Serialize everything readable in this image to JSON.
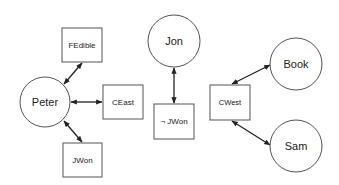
{
  "diagram": {
    "type": "graph",
    "nodes": [
      {
        "id": "peter",
        "label": "Peter",
        "shape": "circle",
        "cx": 45,
        "cy": 102,
        "r": 25
      },
      {
        "id": "fedible",
        "label": "FEdible",
        "shape": "box",
        "x": 62,
        "y": 28,
        "w": 40,
        "h": 34
      },
      {
        "id": "ceast",
        "label": "CEast",
        "shape": "box",
        "x": 103,
        "y": 85,
        "w": 40,
        "h": 34
      },
      {
        "id": "jwon",
        "label": "JWon",
        "shape": "box",
        "x": 63,
        "y": 143,
        "w": 39,
        "h": 34
      },
      {
        "id": "jon",
        "label": "Jon",
        "shape": "circle",
        "cx": 174,
        "cy": 41,
        "r": 26
      },
      {
        "id": "notjwon",
        "label": "¬ JWon",
        "shape": "box",
        "x": 154,
        "y": 104,
        "w": 40,
        "h": 35
      },
      {
        "id": "cwest",
        "label": "CWest",
        "shape": "box",
        "x": 210,
        "y": 85,
        "w": 40,
        "h": 35
      },
      {
        "id": "book",
        "label": "Book",
        "shape": "circle",
        "cx": 296,
        "cy": 64,
        "r": 26
      },
      {
        "id": "sam",
        "label": "Sam",
        "shape": "circle",
        "cx": 296,
        "cy": 146,
        "r": 26
      }
    ],
    "edges": [
      {
        "from": "peter",
        "to": "fedible",
        "direction": "both"
      },
      {
        "from": "peter",
        "to": "ceast",
        "direction": "both"
      },
      {
        "from": "peter",
        "to": "jwon",
        "direction": "both"
      },
      {
        "from": "jon",
        "to": "notjwon",
        "direction": "both"
      },
      {
        "from": "cwest",
        "to": "book",
        "direction": "both"
      },
      {
        "from": "cwest",
        "to": "sam",
        "direction": "both"
      }
    ],
    "colors": {
      "stroke": "#555555",
      "edge": "#222222",
      "text": "#222222",
      "background": "#ffffff"
    }
  }
}
